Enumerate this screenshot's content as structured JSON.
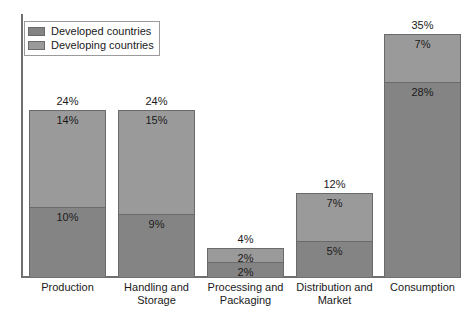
{
  "chart_data": {
    "type": "bar",
    "title": "",
    "xlabel": "",
    "ylabel": "",
    "stacked": true,
    "grid": false,
    "legend_position": "top-left",
    "ylim": [
      0,
      35
    ],
    "categories": [
      "Production",
      "Handling and Storage",
      "Processing and Packaging",
      "Distribution and Market",
      "Consumption"
    ],
    "series": [
      {
        "name": "Developed countries",
        "color": "#848484",
        "values": [
          10,
          9,
          2,
          5,
          28
        ],
        "labels": [
          "10%",
          "9%",
          "2%",
          "5%",
          "28%"
        ]
      },
      {
        "name": "Developing countries",
        "color": "#9a9a9a",
        "values": [
          14,
          15,
          2,
          7,
          7
        ],
        "labels": [
          "14%",
          "15%",
          "2%",
          "7%",
          "7%"
        ]
      }
    ],
    "totals": [
      24,
      24,
      4,
      12,
      35
    ],
    "total_labels": [
      "24%",
      "24%",
      "4%",
      "12%",
      "35%"
    ]
  },
  "legend": {
    "items": [
      {
        "label": "Developed countries",
        "swatch": "legend-swatch-developed"
      },
      {
        "label": "Developing countries",
        "swatch": "legend-swatch-developing"
      }
    ]
  },
  "category_lines": [
    [
      "Production",
      ""
    ],
    [
      "Handling and",
      "Storage"
    ],
    [
      "Processing and",
      "Packaging"
    ],
    [
      "Distribution and",
      "Market"
    ],
    [
      "Consumption",
      ""
    ]
  ]
}
